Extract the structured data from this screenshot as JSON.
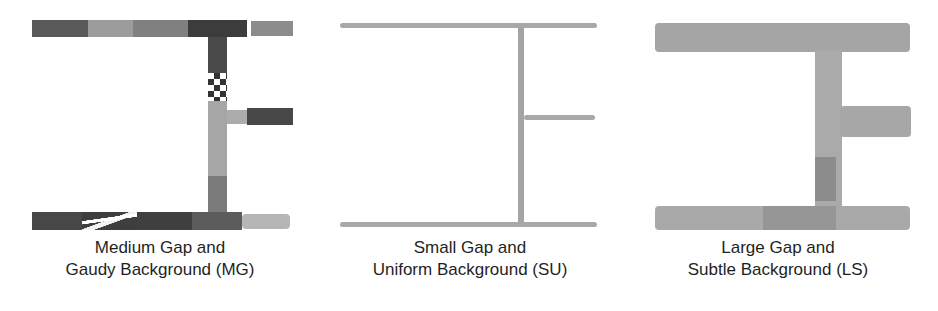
{
  "figure": {
    "panels": [
      {
        "id": "MG",
        "caption_line1": "Medium Gap and",
        "caption_line2": "Gaudy Background (MG)",
        "gap": "Medium",
        "background": "Gaudy",
        "colors": {
          "dark": "#3a3a3a",
          "mid": "#7a7a7a",
          "light": "#b4b4b4"
        }
      },
      {
        "id": "SU",
        "caption_line1": "Small Gap and",
        "caption_line2": "Uniform Background (SU)",
        "gap": "Small",
        "background": "Uniform",
        "colors": {
          "stroke": "#a8a8a8"
        }
      },
      {
        "id": "LS",
        "caption_line1": "Large Gap and",
        "caption_line2": "Subtle Background (LS)",
        "gap": "Large",
        "background": "Subtle",
        "colors": {
          "base": "#a9a9a9",
          "darker": "#8e8e8e"
        }
      }
    ]
  }
}
